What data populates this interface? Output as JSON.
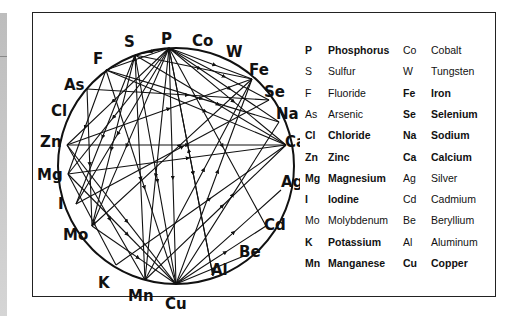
{
  "diagram": {
    "nodes": [
      {
        "id": "P",
        "x": 169,
        "y": 48,
        "lx": 161,
        "ly": 44
      },
      {
        "id": "Co",
        "x": 201,
        "y": 52,
        "lx": 192,
        "ly": 46
      },
      {
        "id": "W",
        "x": 228,
        "y": 64,
        "lx": 226,
        "ly": 57
      },
      {
        "id": "Fe",
        "x": 252,
        "y": 79,
        "lx": 249,
        "ly": 75
      },
      {
        "id": "Se",
        "x": 269,
        "y": 100,
        "lx": 264,
        "ly": 97
      },
      {
        "id": "Na",
        "x": 279,
        "y": 122,
        "lx": 276,
        "ly": 119
      },
      {
        "id": "Ca",
        "x": 286,
        "y": 145,
        "lx": 285,
        "ly": 147
      },
      {
        "id": "Ag",
        "x": 281,
        "y": 190,
        "lx": 281,
        "ly": 187
      },
      {
        "id": "Cd",
        "x": 266,
        "y": 226,
        "lx": 264,
        "ly": 230
      },
      {
        "id": "Be",
        "x": 244,
        "y": 256,
        "lx": 239,
        "ly": 257
      },
      {
        "id": "Al",
        "x": 213,
        "y": 276,
        "lx": 211,
        "ly": 275
      },
      {
        "id": "Cu",
        "x": 176,
        "y": 284,
        "lx": 165,
        "ly": 309
      },
      {
        "id": "Mn",
        "x": 145,
        "y": 280,
        "lx": 128,
        "ly": 301
      },
      {
        "id": "K",
        "x": 116,
        "y": 265,
        "lx": 98,
        "ly": 288
      },
      {
        "id": "Mo",
        "x": 92,
        "y": 226,
        "lx": 63,
        "ly": 240
      },
      {
        "id": "I",
        "x": 76,
        "y": 204,
        "lx": 58,
        "ly": 209
      },
      {
        "id": "Mg",
        "x": 68,
        "y": 174,
        "lx": 37,
        "ly": 180
      },
      {
        "id": "Zn",
        "x": 67,
        "y": 145,
        "lx": 40,
        "ly": 147
      },
      {
        "id": "Cl",
        "x": 74,
        "y": 112,
        "lx": 51,
        "ly": 116
      },
      {
        "id": "As",
        "x": 87,
        "y": 89,
        "lx": 64,
        "ly": 90
      },
      {
        "id": "F",
        "x": 106,
        "y": 70,
        "lx": 93,
        "ly": 64
      },
      {
        "id": "S",
        "x": 135,
        "y": 55,
        "lx": 124,
        "ly": 47
      }
    ],
    "edges": [
      [
        "P",
        "S"
      ],
      [
        "P",
        "F"
      ],
      [
        "P",
        "Zn"
      ],
      [
        "P",
        "Mg"
      ],
      [
        "P",
        "I"
      ],
      [
        "P",
        "Mo"
      ],
      [
        "P",
        "Mn"
      ],
      [
        "P",
        "Cu"
      ],
      [
        "P",
        "Al"
      ],
      [
        "P",
        "Fe"
      ],
      [
        "P",
        "Se"
      ],
      [
        "P",
        "Na"
      ],
      [
        "P",
        "Ca"
      ],
      [
        "P",
        "Cd"
      ],
      [
        "S",
        "Fe"
      ],
      [
        "S",
        "Ca"
      ],
      [
        "S",
        "Mo"
      ],
      [
        "S",
        "I"
      ],
      [
        "S",
        "Cu"
      ],
      [
        "S",
        "Mn"
      ],
      [
        "F",
        "Ca"
      ],
      [
        "F",
        "Mg"
      ],
      [
        "F",
        "Cu"
      ],
      [
        "F",
        "Na"
      ],
      [
        "As",
        "Se"
      ],
      [
        "As",
        "Mo"
      ],
      [
        "Zn",
        "Ca"
      ],
      [
        "Zn",
        "Fe"
      ],
      [
        "Zn",
        "Cu"
      ],
      [
        "Zn",
        "Mn"
      ],
      [
        "Mg",
        "Ca"
      ],
      [
        "Mg",
        "Cu"
      ],
      [
        "Mg",
        "K"
      ],
      [
        "I",
        "Se"
      ],
      [
        "Mo",
        "Cu"
      ],
      [
        "Mo",
        "Fe"
      ],
      [
        "K",
        "Ca"
      ],
      [
        "Mn",
        "Ca"
      ],
      [
        "Mn",
        "Fe"
      ],
      [
        "Cu",
        "Ag"
      ],
      [
        "Cu",
        "Cd"
      ],
      [
        "Cu",
        "Be"
      ],
      [
        "Cu",
        "Fe"
      ],
      [
        "Cu",
        "Na"
      ],
      [
        "Al",
        "P"
      ]
    ]
  },
  "legend": {
    "rows": [
      {
        "sym": "P",
        "name": "Phosphorus",
        "bold": true,
        "sym2": "Co",
        "name2": "Cobalt",
        "bold2": false
      },
      {
        "sym": "S",
        "name": "Sulfur",
        "bold": false,
        "sym2": "W",
        "name2": "Tungsten",
        "bold2": false
      },
      {
        "sym": "F",
        "name": "Fluoride",
        "bold": false,
        "sym2": "Fe",
        "name2": "Iron",
        "bold2": true
      },
      {
        "sym": "As",
        "name": "Arsenic",
        "bold": false,
        "sym2": "Se",
        "name2": "Selenium",
        "bold2": true
      },
      {
        "sym": "Cl",
        "name": "Chloride",
        "bold": true,
        "sym2": "Na",
        "name2": "Sodium",
        "bold2": true
      },
      {
        "sym": "Zn",
        "name": "Zinc",
        "bold": true,
        "sym2": "Ca",
        "name2": "Calcium",
        "bold2": true
      },
      {
        "sym": "Mg",
        "name": "Magnesium",
        "bold": true,
        "sym2": "Ag",
        "name2": "Silver",
        "bold2": false
      },
      {
        "sym": "I",
        "name": "Iodine",
        "bold": true,
        "sym2": "Cd",
        "name2": "Cadmium",
        "bold2": false
      },
      {
        "sym": "Mo",
        "name": "Molybdenum",
        "bold": false,
        "sym2": "Be",
        "name2": "Beryllium",
        "bold2": false
      },
      {
        "sym": "K",
        "name": "Potassium",
        "bold": true,
        "sym2": "Al",
        "name2": "Aluminum",
        "bold2": false
      },
      {
        "sym": "Mn",
        "name": "Manganese",
        "bold": true,
        "sym2": "Cu",
        "name2": "Copper",
        "bold2": true
      }
    ]
  }
}
